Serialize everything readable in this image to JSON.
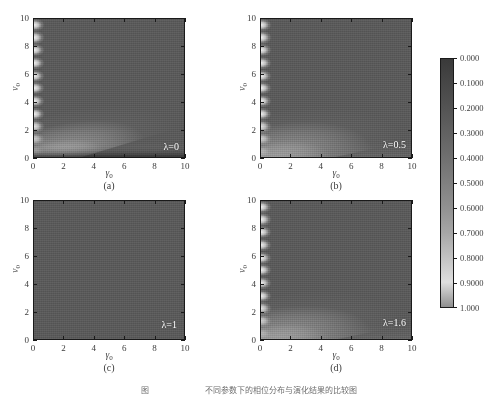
{
  "figure": {
    "width": 497,
    "height": 395,
    "background": "#ffffff",
    "caption_clipped": "图　　　　　　　不同参数下的相位分布与演化结果的比较图"
  },
  "axes": {
    "xlabel_main": "γ",
    "xlabel_sub": "0",
    "ylabel_main": "v",
    "ylabel_sub": "0",
    "xticks": [
      0,
      2,
      4,
      6,
      8,
      10
    ],
    "yticks": [
      0,
      2,
      4,
      6,
      8,
      10
    ],
    "xtick_labels": [
      "0",
      "2",
      "4",
      "6",
      "8",
      "10"
    ],
    "ytick_labels": [
      "0",
      "2",
      "4",
      "6",
      "8",
      "10"
    ],
    "xlim": [
      0,
      10
    ],
    "ylim": [
      0,
      10
    ]
  },
  "colorbar": {
    "orientation": "vertical",
    "vmin": 0.0,
    "vmax": 1.0,
    "colormap": "grayscale-dark-to-light",
    "tick_values": [
      0.0,
      0.1,
      0.2,
      0.3,
      0.4,
      0.5,
      0.6,
      0.7,
      0.8,
      0.9,
      1.0
    ],
    "tick_labels": [
      "0.000",
      "0.1000",
      "0.2000",
      "0.3000",
      "0.4000",
      "0.5000",
      "0.6000",
      "0.7000",
      "0.8000",
      "0.9000",
      "1.000"
    ],
    "colors": {
      "low": "#3a3a3a",
      "mid": "#808080",
      "high": "#dedede"
    }
  },
  "panels": [
    {
      "letter": "(a)",
      "lambda_label": "λ=0",
      "lambda_value": 0,
      "has_band": true,
      "band_intensity": 1.0,
      "band_slope": 0.3,
      "band_thickness": 0.34,
      "has_bottom_rim": true,
      "lobe_count": 11,
      "uniform": false
    },
    {
      "letter": "(b)",
      "lambda_label": "λ=0.5",
      "lambda_value": 0.5,
      "has_band": true,
      "band_intensity": 0.95,
      "band_slope": 0.22,
      "band_thickness": 0.4,
      "has_bottom_rim": false,
      "lobe_count": 11,
      "uniform": false
    },
    {
      "letter": "(c)",
      "lambda_label": "λ=1",
      "lambda_value": 1,
      "has_band": false,
      "band_intensity": 0,
      "band_slope": 0,
      "band_thickness": 0,
      "has_bottom_rim": false,
      "lobe_count": 0,
      "uniform": true
    },
    {
      "letter": "(d)",
      "lambda_label": "λ=1.6",
      "lambda_value": 1.6,
      "has_band": true,
      "band_intensity": 0.98,
      "band_slope": 0.2,
      "band_thickness": 0.38,
      "has_bottom_rim": false,
      "lobe_count": 11,
      "uniform": false
    }
  ],
  "chart_data": {
    "type": "heatmap",
    "title": "",
    "subplots": 4,
    "layout": "2x2 grid with shared vertical colorbar",
    "xlabel": "γ0",
    "ylabel": "v0",
    "xlim": [
      0,
      10
    ],
    "ylim": [
      0,
      10
    ],
    "zlim": [
      0,
      1
    ],
    "colormap": "gray",
    "grid": false,
    "legend": "none",
    "colorbar_position": "right",
    "series": [
      {
        "name": "λ=0",
        "panel": "(a)",
        "background_level": 0.3,
        "annotation": "λ=0",
        "features": [
          "bright high-value band rising from (γ0≈0, v0≈0.3) to (γ0=10, v0≈2.6)",
          "periodic bright lobes along γ0≈0 edge at v0 ≈ 0.5,1.4,2.3,3.2,4.1,5.0,5.9,6.8,7.7,8.6,9.5",
          "dark rim strip along bottom edge"
        ]
      },
      {
        "name": "λ=0.5",
        "panel": "(b)",
        "background_level": 0.3,
        "annotation": "λ=0.5",
        "features": [
          "bright band rising from (γ0≈0, v0≈0.1) to (γ0=10, v0≈2.0)",
          "periodic bright lobes along γ0≈0 edge"
        ]
      },
      {
        "name": "λ=1",
        "panel": "(c)",
        "background_level": 0.3,
        "annotation": "λ=1",
        "features": [
          "uniform field, no band, no edge lobes"
        ]
      },
      {
        "name": "λ=1.6",
        "panel": "(d)",
        "background_level": 0.3,
        "annotation": "λ=1.6",
        "features": [
          "bright band rising from (γ0≈0, v0≈0.2) to (γ0=10, v0≈2.2)",
          "periodic bright lobes along γ0≈0 edge"
        ]
      }
    ]
  }
}
